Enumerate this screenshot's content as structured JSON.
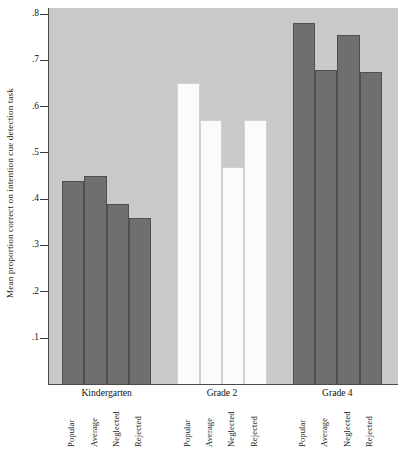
{
  "chart_data": {
    "type": "bar",
    "title": "",
    "subtitle": "",
    "xlabel": "",
    "ylabel": "Mean proportion correct on intention cue detection task",
    "ylim": [
      0.0,
      0.83
    ],
    "yticks": [
      ".8",
      ".7",
      ".6",
      ".5",
      ".4",
      ".3",
      ".2",
      ".1"
    ],
    "ytick_values": [
      0.8,
      0.7,
      0.6,
      0.5,
      0.4,
      0.3,
      0.2,
      0.1
    ],
    "grid": false,
    "legend": null,
    "plot_background": "#c9c9c9",
    "bar_colors": {
      "dark": "#6f6f6f",
      "light": "#fbfbfb"
    },
    "categories": [
      "Popular",
      "Average",
      "Neglected",
      "Rejected"
    ],
    "groups": [
      "Kindergarten",
      "Grade 2",
      "Grade 4"
    ],
    "series": [
      {
        "name": "Kindergarten",
        "style": "dark",
        "values": [
          0.44,
          0.45,
          0.39,
          0.36
        ]
      },
      {
        "name": "Grade 2",
        "style": "light",
        "values": [
          0.65,
          0.57,
          0.47,
          0.57
        ]
      },
      {
        "name": "Grade 4",
        "style": "dark",
        "values": [
          0.78,
          0.68,
          0.755,
          0.675
        ]
      }
    ]
  }
}
